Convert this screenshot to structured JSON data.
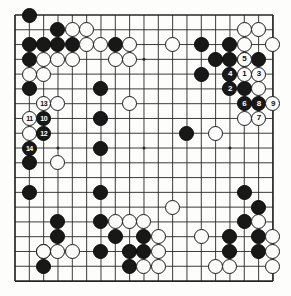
{
  "diagram": {
    "kind": "go-board-diagram",
    "board_size": 19,
    "colors": {
      "board_background": "#fdfdfb",
      "grid_line": "#262626",
      "black_stone": "#181818",
      "white_stone": "#fcfcfc",
      "stone_outline": "#1a1a1a",
      "black_label_text": "#ffffff",
      "white_label_text": "#101010"
    },
    "geometry": {
      "left": 15,
      "top": 15,
      "right": 273,
      "bottom": 281,
      "col_spacing": 14.33,
      "row_spacing": 14.78,
      "stone_diameter": 15
    },
    "star_points": [
      {
        "col": 4,
        "row": 4
      },
      {
        "col": 10,
        "row": 4
      },
      {
        "col": 16,
        "row": 4
      },
      {
        "col": 4,
        "row": 10
      },
      {
        "col": 10,
        "row": 10
      },
      {
        "col": 16,
        "row": 10
      },
      {
        "col": 4,
        "row": 16
      },
      {
        "col": 10,
        "row": 16
      },
      {
        "col": 16,
        "row": 16
      }
    ],
    "move_numbers": [
      {
        "label": "1",
        "color": "white",
        "col": 17,
        "row": 5
      },
      {
        "label": "2",
        "color": "black",
        "col": 16,
        "row": 6
      },
      {
        "label": "3",
        "color": "white",
        "col": 18,
        "row": 5
      },
      {
        "label": "4",
        "color": "black",
        "col": 16,
        "row": 5
      },
      {
        "label": "5",
        "color": "white",
        "col": 17,
        "row": 4
      },
      {
        "label": "6",
        "color": "black",
        "col": 17,
        "row": 7
      },
      {
        "label": "7",
        "color": "white",
        "col": 18,
        "row": 8
      },
      {
        "label": "8",
        "color": "black",
        "col": 18,
        "row": 7
      },
      {
        "label": "9",
        "color": "white",
        "col": 19,
        "row": 7
      },
      {
        "label": "10",
        "color": "black",
        "col": 3,
        "row": 8
      },
      {
        "label": "11",
        "color": "white",
        "col": 2,
        "row": 8
      },
      {
        "label": "12",
        "color": "black",
        "col": 3,
        "row": 9
      },
      {
        "label": "13",
        "color": "white",
        "col": 3,
        "row": 7
      },
      {
        "label": "14",
        "color": "black",
        "col": 2,
        "row": 10
      }
    ],
    "black_stones": [
      {
        "col": 2,
        "row": 1
      },
      {
        "col": 4,
        "row": 2
      },
      {
        "col": 2,
        "row": 3
      },
      {
        "col": 3,
        "row": 3
      },
      {
        "col": 4,
        "row": 3
      },
      {
        "col": 5,
        "row": 3
      },
      {
        "col": 8,
        "row": 3
      },
      {
        "col": 14,
        "row": 3
      },
      {
        "col": 16,
        "row": 3
      },
      {
        "col": 2,
        "row": 4
      },
      {
        "col": 15,
        "row": 4
      },
      {
        "col": 18,
        "row": 4
      },
      {
        "col": 2,
        "row": 6
      },
      {
        "col": 14,
        "row": 5
      },
      {
        "col": 16,
        "row": 4
      },
      {
        "col": 7,
        "row": 6
      },
      {
        "col": 7,
        "row": 8
      },
      {
        "col": 17,
        "row": 6
      },
      {
        "col": 7,
        "row": 10
      },
      {
        "col": 13,
        "row": 9
      },
      {
        "col": 2,
        "row": 11
      },
      {
        "col": 2,
        "row": 13
      },
      {
        "col": 7,
        "row": 13
      },
      {
        "col": 17,
        "row": 13
      },
      {
        "col": 18,
        "row": 14
      },
      {
        "col": 4,
        "row": 15
      },
      {
        "col": 7,
        "row": 15
      },
      {
        "col": 17,
        "row": 15
      },
      {
        "col": 4,
        "row": 16
      },
      {
        "col": 8,
        "row": 16
      },
      {
        "col": 10,
        "row": 16
      },
      {
        "col": 16,
        "row": 16
      },
      {
        "col": 18,
        "row": 16
      },
      {
        "col": 3,
        "row": 17
      },
      {
        "col": 7,
        "row": 17
      },
      {
        "col": 9,
        "row": 17
      },
      {
        "col": 10,
        "row": 17
      },
      {
        "col": 16,
        "row": 17
      },
      {
        "col": 18,
        "row": 17
      },
      {
        "col": 3,
        "row": 18
      },
      {
        "col": 9,
        "row": 18
      }
    ],
    "white_stones": [
      {
        "col": 5,
        "row": 2
      },
      {
        "col": 6,
        "row": 2
      },
      {
        "col": 17,
        "row": 2
      },
      {
        "col": 18,
        "row": 2
      },
      {
        "col": 6,
        "row": 3
      },
      {
        "col": 7,
        "row": 3
      },
      {
        "col": 9,
        "row": 3
      },
      {
        "col": 17,
        "row": 3
      },
      {
        "col": 19,
        "row": 3
      },
      {
        "col": 3,
        "row": 4
      },
      {
        "col": 4,
        "row": 4
      },
      {
        "col": 5,
        "row": 4
      },
      {
        "col": 8,
        "row": 4
      },
      {
        "col": 9,
        "row": 4
      },
      {
        "col": 12,
        "row": 3
      },
      {
        "col": 17,
        "row": 4
      },
      {
        "col": 2,
        "row": 5
      },
      {
        "col": 3,
        "row": 5
      },
      {
        "col": 18,
        "row": 6
      },
      {
        "col": 4,
        "row": 7
      },
      {
        "col": 9,
        "row": 7
      },
      {
        "col": 17,
        "row": 8
      },
      {
        "col": 15,
        "row": 9
      },
      {
        "col": 2,
        "row": 9
      },
      {
        "col": 4,
        "row": 11
      },
      {
        "col": 12,
        "row": 14
      },
      {
        "col": 8,
        "row": 15
      },
      {
        "col": 9,
        "row": 15
      },
      {
        "col": 10,
        "row": 15
      },
      {
        "col": 18,
        "row": 15
      },
      {
        "col": 11,
        "row": 16
      },
      {
        "col": 19,
        "row": 16
      },
      {
        "col": 3,
        "row": 17
      },
      {
        "col": 4,
        "row": 17
      },
      {
        "col": 5,
        "row": 17
      },
      {
        "col": 11,
        "row": 17
      },
      {
        "col": 14,
        "row": 16
      },
      {
        "col": 19,
        "row": 17
      },
      {
        "col": 10,
        "row": 18
      },
      {
        "col": 11,
        "row": 18
      },
      {
        "col": 15,
        "row": 18
      },
      {
        "col": 16,
        "row": 18
      },
      {
        "col": 19,
        "row": 18
      }
    ]
  }
}
